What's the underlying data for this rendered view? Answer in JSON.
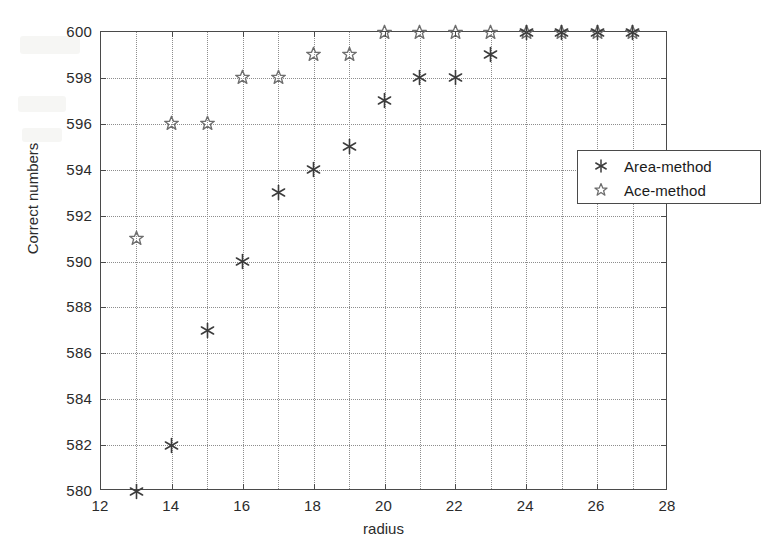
{
  "chart_data": {
    "type": "scatter",
    "title": "",
    "xlabel": "radius",
    "ylabel": "Correct numbers",
    "xlim": [
      12,
      28
    ],
    "ylim": [
      580,
      600
    ],
    "xticks": [
      12,
      14,
      16,
      18,
      20,
      22,
      24,
      26,
      28
    ],
    "yticks": [
      580,
      582,
      584,
      586,
      588,
      590,
      592,
      594,
      596,
      598,
      600
    ],
    "x_minor_gridlines": [
      13,
      15,
      17,
      19,
      21,
      23,
      25,
      27
    ],
    "y_minor_gridlines": [],
    "grid": true,
    "grid_style": "dotted",
    "legend_position": "upper right inside",
    "series": [
      {
        "name": "Area-method",
        "marker": "asterisk",
        "marker_color": "#3c3c3c",
        "filled": true,
        "x": [
          13,
          14,
          15,
          16,
          17,
          18,
          19,
          20,
          21,
          22,
          23,
          24,
          25,
          26,
          27
        ],
        "y": [
          580,
          582,
          587,
          590,
          593,
          594,
          595,
          597,
          598,
          598,
          599,
          600,
          600,
          600,
          600
        ]
      },
      {
        "name": "Ace-method",
        "marker": "star-open",
        "marker_color": "#6e6e6e",
        "filled": false,
        "x": [
          13,
          14,
          15,
          16,
          17,
          18,
          19,
          20,
          21,
          22,
          23,
          24,
          25,
          26,
          27
        ],
        "y": [
          591,
          596,
          596,
          598,
          598,
          599,
          599,
          600,
          600,
          600,
          600,
          600,
          600,
          600,
          600
        ]
      }
    ]
  },
  "axes": {
    "xlabel": "radius",
    "ylabel": "Correct numbers",
    "xtick_labels": [
      "12",
      "14",
      "16",
      "18",
      "20",
      "22",
      "24",
      "26",
      "28"
    ],
    "ytick_labels": [
      "580",
      "582",
      "584",
      "586",
      "588",
      "590",
      "592",
      "594",
      "596",
      "598",
      "600"
    ]
  },
  "legend": {
    "entries": [
      {
        "symbol": "asterisk",
        "label": "Area-method"
      },
      {
        "symbol": "star-open",
        "label": "Ace-method"
      }
    ]
  },
  "colors": {
    "axis": "#4a4a4a",
    "grid": "#8d8d8d",
    "area_marker": "#3c3c3c",
    "ace_marker": "#6e6e6e",
    "text": "#1a1a1a",
    "background": "#ffffff"
  }
}
